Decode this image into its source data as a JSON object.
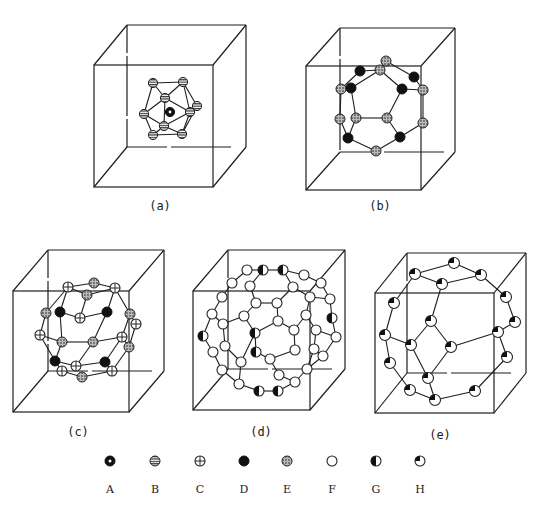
{
  "panels": [
    {
      "id": "a",
      "caption": "(a)",
      "atom_types": [
        "A",
        "B"
      ]
    },
    {
      "id": "b",
      "caption": "(b)",
      "atom_types": [
        "D",
        "E"
      ]
    },
    {
      "id": "c",
      "caption": "(c)",
      "atom_types": [
        "C",
        "D",
        "E"
      ]
    },
    {
      "id": "d",
      "caption": "(d)",
      "atom_types": [
        "F",
        "G"
      ]
    },
    {
      "id": "e",
      "caption": "(e)",
      "atom_types": [
        "H"
      ]
    }
  ],
  "legend": [
    {
      "key": "A",
      "label": "A",
      "symbol": "dot-in-black-circle"
    },
    {
      "key": "B",
      "label": "B",
      "symbol": "horizontal-striped-circle"
    },
    {
      "key": "C",
      "label": "C",
      "symbol": "crossed-circle"
    },
    {
      "key": "D",
      "label": "D",
      "symbol": "solid-black-circle"
    },
    {
      "key": "E",
      "label": "E",
      "symbol": "speckled-circle"
    },
    {
      "key": "F",
      "label": "F",
      "symbol": "open-circle"
    },
    {
      "key": "G",
      "label": "G",
      "symbol": "half-filled-circle"
    },
    {
      "key": "H",
      "label": "H",
      "symbol": "quarter-filled-circle"
    }
  ]
}
